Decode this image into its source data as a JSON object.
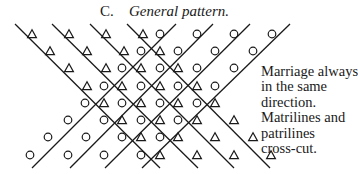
{
  "figure": {
    "label": "C.",
    "title": "General pattern.",
    "caption_lines": [
      "Marriage always",
      "in the same",
      "direction.",
      "Matrilines and",
      "patrilines",
      "cross-cut."
    ],
    "legend_symbols": {
      "triangle": "male",
      "circle": "female"
    },
    "lines": {
      "descending": [
        [
          15,
          24,
          160,
          168
        ],
        [
          52,
          24,
          198,
          168
        ],
        [
          90,
          24,
          234,
          168
        ],
        [
          127,
          24,
          270,
          168
        ]
      ],
      "ascending": [
        [
          32,
          168,
          176,
          24
        ],
        [
          70,
          168,
          213,
          24
        ],
        [
          105,
          168,
          250,
          24
        ],
        [
          142,
          168,
          290,
          24
        ]
      ]
    },
    "rows": [
      {
        "y": 34,
        "symbols": [
          [
            "t",
            32
          ],
          [
            "t",
            69
          ],
          [
            "t",
            106
          ],
          [
            "t",
            143
          ],
          [
            "c",
            160
          ],
          [
            "c",
            197
          ],
          [
            "c",
            234
          ],
          [
            "c",
            272
          ]
        ]
      },
      {
        "y": 51,
        "symbols": [
          [
            "t",
            50
          ],
          [
            "t",
            87
          ],
          [
            "t",
            124
          ],
          [
            "c",
            141
          ],
          [
            "t",
            160
          ],
          [
            "c",
            178
          ],
          [
            "c",
            215
          ],
          [
            "c",
            253
          ]
        ]
      },
      {
        "y": 68,
        "symbols": [
          [
            "t",
            69
          ],
          [
            "t",
            106
          ],
          [
            "c",
            122
          ],
          [
            "t",
            141
          ],
          [
            "c",
            160
          ],
          [
            "t",
            178
          ],
          [
            "c",
            197
          ],
          [
            "c",
            234
          ]
        ]
      },
      {
        "y": 86,
        "symbols": [
          [
            "t",
            87
          ],
          [
            "c",
            104
          ],
          [
            "t",
            122
          ],
          [
            "c",
            141
          ],
          [
            "t",
            160
          ],
          [
            "c",
            178
          ],
          [
            "t",
            197
          ],
          [
            "c",
            215
          ]
        ]
      },
      {
        "y": 103,
        "symbols": [
          [
            "c",
            85
          ],
          [
            "t",
            104
          ],
          [
            "c",
            122
          ],
          [
            "t",
            141
          ],
          [
            "c",
            160
          ],
          [
            "t",
            178
          ],
          [
            "c",
            197
          ],
          [
            "t",
            215
          ]
        ]
      },
      {
        "y": 120,
        "symbols": [
          [
            "c",
            68
          ],
          [
            "c",
            104
          ],
          [
            "t",
            122
          ],
          [
            "c",
            141
          ],
          [
            "t",
            160
          ],
          [
            "c",
            178
          ],
          [
            "t",
            197
          ],
          [
            "t",
            234
          ]
        ]
      },
      {
        "y": 137,
        "symbols": [
          [
            "c",
            48
          ],
          [
            "c",
            86
          ],
          [
            "c",
            122
          ],
          [
            "t",
            141
          ],
          [
            "c",
            160
          ],
          [
            "t",
            178
          ],
          [
            "t",
            215
          ],
          [
            "t",
            253
          ]
        ]
      },
      {
        "y": 155,
        "symbols": [
          [
            "c",
            30
          ],
          [
            "c",
            68
          ],
          [
            "c",
            104
          ],
          [
            "c",
            141
          ],
          [
            "t",
            160
          ],
          [
            "t",
            197
          ],
          [
            "t",
            234
          ],
          [
            "t",
            271
          ]
        ]
      }
    ],
    "colors": {
      "ink": "#1a1a1a",
      "background": "#ffffff"
    }
  }
}
